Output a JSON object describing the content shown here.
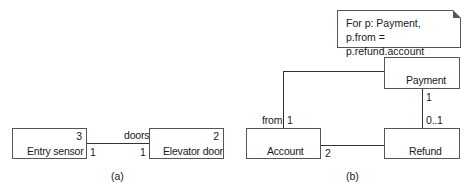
{
  "diagram_a": {
    "caption": "(a)",
    "entry_sensor": {
      "label": "Entry sensor",
      "count": "3",
      "mult": "1"
    },
    "elevator_door": {
      "label": "Elevator door",
      "count": "2",
      "mult": "1"
    },
    "association": {
      "role": "doors"
    }
  },
  "diagram_b": {
    "caption": "(b)",
    "note": {
      "line1": "For p: Payment,",
      "line2": "p.from = p.refund.account"
    },
    "payment": {
      "label": "Payment",
      "mult_refund": "1"
    },
    "account": {
      "label": "Account",
      "role": "from",
      "mult_payment": "1",
      "mult_refund": "2"
    },
    "refund": {
      "label": "Refund",
      "mult_payment": "0..1"
    }
  }
}
